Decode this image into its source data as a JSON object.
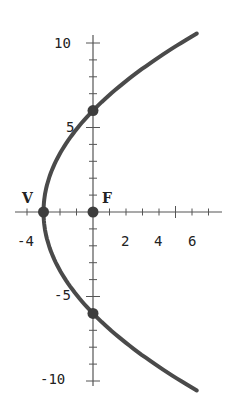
{
  "chart_data": {
    "type": "line",
    "title": "",
    "xlabel": "",
    "ylabel": "",
    "equation": "y^2 = 12(x + 3)",
    "xlim": [
      -4.7,
      7.7
    ],
    "ylim": [
      -10.5,
      10.5
    ],
    "grid": false,
    "x_tick_labels": [
      "-4",
      "2",
      "4",
      "6"
    ],
    "y_tick_labels": [
      "10",
      "5",
      "-5",
      "-10"
    ],
    "series": [
      {
        "name": "parabola",
        "points": [
          {
            "x": 6.3,
            "y": 10.56
          },
          {
            "x": 5,
            "y": 9.8
          },
          {
            "x": 4,
            "y": 9.17
          },
          {
            "x": 3,
            "y": 8.49
          },
          {
            "x": 2,
            "y": 7.75
          },
          {
            "x": 1,
            "y": 6.93
          },
          {
            "x": 0,
            "y": 6
          },
          {
            "x": -1,
            "y": 4.9
          },
          {
            "x": -2,
            "y": 3.46
          },
          {
            "x": -2.5,
            "y": 2.45
          },
          {
            "x": -3,
            "y": 0
          },
          {
            "x": -2.5,
            "y": -2.45
          },
          {
            "x": -2,
            "y": -3.46
          },
          {
            "x": -1,
            "y": -4.9
          },
          {
            "x": 0,
            "y": -6
          },
          {
            "x": 1,
            "y": -6.93
          },
          {
            "x": 2,
            "y": -7.75
          },
          {
            "x": 3,
            "y": -8.49
          },
          {
            "x": 4,
            "y": -9.17
          },
          {
            "x": 5,
            "y": -9.8
          },
          {
            "x": 6.3,
            "y": -10.56
          }
        ]
      }
    ],
    "marked_points": [
      {
        "label": "V",
        "x": -3,
        "y": 0
      },
      {
        "label": "F",
        "x": 0,
        "y": 0
      },
      {
        "label": "",
        "x": 0,
        "y": 6
      },
      {
        "label": "",
        "x": 0,
        "y": -6
      }
    ]
  }
}
